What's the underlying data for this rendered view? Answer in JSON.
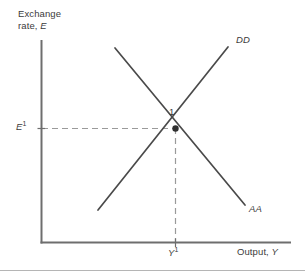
{
  "figure": {
    "name": "dd-aa-equilibrium-diagram",
    "axes": {
      "y_title_line1": "Exchange",
      "y_title_line2_prefix": "rate, ",
      "y_title_variable": "E",
      "x_title_prefix": "Output, ",
      "x_title_variable": "Y"
    },
    "ticks": {
      "y_value_base": "E",
      "y_value_sup": "1",
      "x_value_base": "Y",
      "x_value_sup": "1"
    },
    "curves": [
      {
        "id": "dd",
        "label": "DD",
        "slope": "upward",
        "description": "Output market equilibrium schedule, upward sloping"
      },
      {
        "id": "aa",
        "label": "AA",
        "slope": "downward",
        "description": "Asset market equilibrium schedule, downward sloping"
      }
    ],
    "equilibrium": {
      "label": "1",
      "description": "Intersection of DD and AA schedules"
    },
    "colors": {
      "axis": "#6e6e6e",
      "curve": "#4a4a4a",
      "dashed_guide": "#9a9a9a",
      "text": "#3b3b3b",
      "marker": "#2f2f2f",
      "footer_rule": "#b5b5b5",
      "background": "#ffffff"
    }
  }
}
